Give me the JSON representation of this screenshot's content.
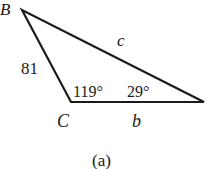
{
  "figure": {
    "caption": "(a)",
    "vertices": {
      "B": {
        "label": "B",
        "x": 22,
        "y": 10
      },
      "C": {
        "label": "C",
        "x": 71,
        "y": 102
      },
      "A": {
        "label": "",
        "x": 204,
        "y": 102
      }
    },
    "sides": {
      "a": {
        "label": "81"
      },
      "b": {
        "label": "b"
      },
      "c": {
        "label": "c"
      }
    },
    "angles": {
      "C": {
        "label": "119°"
      },
      "A": {
        "label": "29°"
      }
    },
    "stroke_color": "#1a1a1a"
  }
}
